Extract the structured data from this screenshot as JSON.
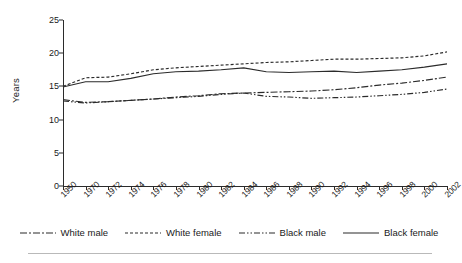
{
  "chart_data": {
    "type": "line",
    "title": "",
    "xlabel": "",
    "ylabel": "Years",
    "ylim": [
      0,
      25
    ],
    "yticks": [
      0,
      5,
      10,
      15,
      20,
      25
    ],
    "grid": false,
    "legend_position": "bottom",
    "x": [
      1950,
      1970,
      1972,
      1974,
      1976,
      1978,
      1980,
      1982,
      1984,
      1986,
      1988,
      1990,
      1992,
      1994,
      1996,
      1998,
      2000,
      2002
    ],
    "xticklabels": [
      "1950",
      "1970",
      "1972",
      "1974",
      "1976",
      "1978",
      "1980",
      "1982",
      "1984",
      "1986",
      "1988",
      "1990",
      "1992",
      "1994",
      "1996",
      "1998",
      "2000",
      "2002"
    ],
    "series": [
      {
        "name": "White male",
        "linestyle": "dash-dot",
        "color": "#2b2b2b",
        "values": [
          13.0,
          12.6,
          12.7,
          12.9,
          13.1,
          13.4,
          13.6,
          13.9,
          14.0,
          14.1,
          14.2,
          14.3,
          14.5,
          14.8,
          15.2,
          15.5,
          15.9,
          16.4
        ]
      },
      {
        "name": "White female",
        "linestyle": "dotted",
        "color": "#2b2b2b",
        "values": [
          15.0,
          16.3,
          16.4,
          16.9,
          17.5,
          17.8,
          18.0,
          18.2,
          18.4,
          18.6,
          18.7,
          18.9,
          19.1,
          19.1,
          19.2,
          19.3,
          19.6,
          20.2
        ]
      },
      {
        "name": "Black male",
        "linestyle": "dash-dot-dot",
        "color": "#2b2b2b",
        "values": [
          12.8,
          12.5,
          12.7,
          12.9,
          13.1,
          13.3,
          13.5,
          13.8,
          14.0,
          13.5,
          13.4,
          13.2,
          13.3,
          13.4,
          13.6,
          13.8,
          14.1,
          14.6
        ]
      },
      {
        "name": "Black female",
        "linestyle": "solid",
        "color": "#2b2b2b",
        "values": [
          14.9,
          15.7,
          15.7,
          16.2,
          16.9,
          17.2,
          17.3,
          17.5,
          17.8,
          17.2,
          17.1,
          17.2,
          17.3,
          17.1,
          17.3,
          17.5,
          17.9,
          18.4
        ]
      }
    ]
  },
  "legend": {
    "items": [
      {
        "label": "White male"
      },
      {
        "label": "White female"
      },
      {
        "label": "Black male"
      },
      {
        "label": "Black female"
      }
    ]
  }
}
